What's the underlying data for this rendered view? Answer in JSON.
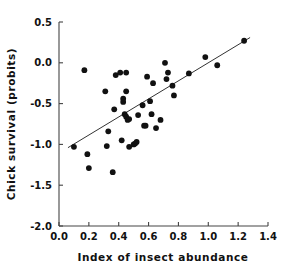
{
  "chart_data": {
    "type": "scatter",
    "title": "",
    "xlabel": "Index of insect abundance",
    "ylabel": "Chick survival (probits)",
    "xlim": [
      0.0,
      1.4
    ],
    "ylim": [
      -2.0,
      0.5
    ],
    "xticks": [
      0.0,
      0.2,
      0.4,
      0.6,
      0.8,
      1.0,
      1.2,
      1.4
    ],
    "yticks": [
      0.5,
      0.0,
      -0.5,
      -1.0,
      -1.5,
      -2.0
    ],
    "xtick_labels": [
      "0.0",
      "0.2",
      "0.4",
      "0.6",
      "0.8",
      "1.0",
      "1.2",
      "1.4"
    ],
    "ytick_labels": [
      "0.5",
      "0.0",
      "-0.5",
      "-1.0",
      "-1.5",
      "-2.0"
    ],
    "grid": false,
    "legend": false,
    "marker": "filled-circle",
    "marker_color": "#111111",
    "marker_size": 4.2,
    "points": [
      [
        0.1,
        -1.03
      ],
      [
        0.17,
        -0.09
      ],
      [
        0.19,
        -1.12
      ],
      [
        0.2,
        -1.29
      ],
      [
        0.31,
        -0.35
      ],
      [
        0.32,
        -1.02
      ],
      [
        0.33,
        -0.84
      ],
      [
        0.36,
        -1.34
      ],
      [
        0.37,
        -0.57
      ],
      [
        0.38,
        -0.15
      ],
      [
        0.41,
        -0.12
      ],
      [
        0.42,
        -0.95
      ],
      [
        0.43,
        -0.44
      ],
      [
        0.43,
        -0.48
      ],
      [
        0.44,
        -0.63
      ],
      [
        0.45,
        -0.35
      ],
      [
        0.45,
        -0.12
      ],
      [
        0.45,
        -0.66
      ],
      [
        0.46,
        -0.7
      ],
      [
        0.47,
        -0.69
      ],
      [
        0.47,
        -1.03
      ],
      [
        0.5,
        -1.0
      ],
      [
        0.51,
        -0.99
      ],
      [
        0.52,
        -0.97
      ],
      [
        0.53,
        -0.64
      ],
      [
        0.56,
        -0.52
      ],
      [
        0.57,
        -0.77
      ],
      [
        0.58,
        -0.77
      ],
      [
        0.59,
        -0.17
      ],
      [
        0.61,
        -0.47
      ],
      [
        0.62,
        -0.63
      ],
      [
        0.63,
        -0.25
      ],
      [
        0.65,
        -0.8
      ],
      [
        0.68,
        -0.7
      ],
      [
        0.71,
        0.0
      ],
      [
        0.72,
        -0.2
      ],
      [
        0.73,
        -0.12
      ],
      [
        0.76,
        -0.28
      ],
      [
        0.77,
        -0.4
      ],
      [
        0.87,
        -0.13
      ],
      [
        0.98,
        0.07
      ],
      [
        1.06,
        -0.03
      ],
      [
        1.24,
        0.27
      ]
    ],
    "fit_line": {
      "type": "linear-regression",
      "x_start": 0.06,
      "y_start": -1.04,
      "x_end": 1.28,
      "y_end": 0.31,
      "color": "#333333",
      "width": 1
    }
  }
}
